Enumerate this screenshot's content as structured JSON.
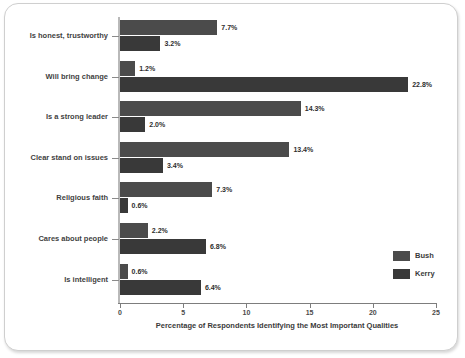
{
  "chart_data": {
    "type": "bar",
    "orientation": "horizontal",
    "title": "",
    "xlabel": "Percentage of Respondents Identifying the Most Important Qualities",
    "ylabel": "",
    "xlim": [
      0,
      25
    ],
    "xticks": [
      0,
      5,
      10,
      15,
      20,
      25
    ],
    "xtick_labels": [
      "0",
      "5",
      "10",
      "15",
      "20",
      "25"
    ],
    "grid": false,
    "legend_position": "right-lower",
    "categories": [
      "Is honest, trustworthy",
      "Will bring change",
      "Is a strong leader",
      "Clear stand on issues",
      "Religious faith",
      "Cares about people",
      "Is intelligent"
    ],
    "series": [
      {
        "name": "Bush",
        "color": "#4b4b4b",
        "values": [
          7.7,
          1.2,
          14.3,
          13.4,
          7.3,
          2.2,
          0.6
        ],
        "labels": [
          "7.7%",
          "1.2%",
          "14.3%",
          "13.4%",
          "7.3%",
          "2.2%",
          "0.6%"
        ]
      },
      {
        "name": "Kerry",
        "color": "#393939",
        "values": [
          3.2,
          22.8,
          2.0,
          3.4,
          0.6,
          6.8,
          6.4
        ],
        "labels": [
          "3.2%",
          "22.8%",
          "2.0%",
          "3.4%",
          "0.6%",
          "6.8%",
          "6.4%"
        ]
      }
    ]
  },
  "legend": {
    "items": [
      {
        "label": "Bush"
      },
      {
        "label": "Kerry"
      }
    ]
  }
}
